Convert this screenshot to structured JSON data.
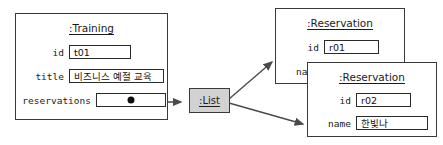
{
  "diagram": {
    "type": "uml-object-diagram",
    "background": "#ffffff",
    "line_color": "#3a3a3a",
    "fill_white": "#ffffff",
    "fill_gray": "#d2d2d2"
  },
  "training_object": {
    "title": ":Training",
    "slots": [
      {
        "label": "id",
        "value": "t01"
      },
      {
        "label": "title",
        "value": "비즈니스 예절 교육"
      },
      {
        "label": "reservations",
        "value": ""
      }
    ]
  },
  "list_object": {
    "title": ":List"
  },
  "reservation_1": {
    "title": ":Reservation",
    "slots": [
      {
        "label": "id",
        "value": "r01"
      },
      {
        "label": "name",
        "value": ""
      }
    ]
  },
  "reservation_2": {
    "title": ":Reservation",
    "slots": [
      {
        "label": "id",
        "value": "r02"
      },
      {
        "label": "name",
        "value": "한빛나"
      }
    ]
  }
}
